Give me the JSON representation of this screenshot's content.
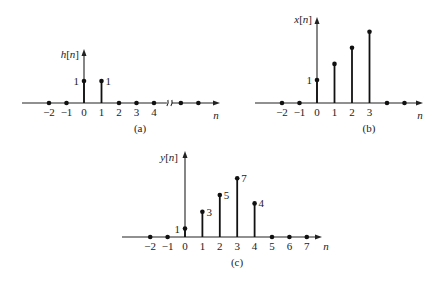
{
  "chart_data": [
    {
      "type": "stem",
      "panel": "a",
      "caption": "(a)",
      "ylabel": "h[n]",
      "xlabel": "n",
      "tick_labels": [
        "−2",
        "−1",
        "0",
        "1",
        "2",
        "3",
        "4"
      ],
      "x": [
        -2,
        -1,
        0,
        1,
        2,
        3,
        4
      ],
      "values": [
        0,
        0,
        1,
        1,
        0,
        0,
        0
      ],
      "value_labels": {
        "0": "1",
        "1": "1"
      },
      "axis_break_after": 4,
      "extra_zero_dots_after_break": 2,
      "origin": {
        "x": 84,
        "y": 103
      },
      "dx": 17.5,
      "px_per_unit": 22,
      "axis_x_range": [
        22,
        220
      ],
      "axis_top": 49,
      "ylabel_pos": {
        "x": 67,
        "y": 58
      },
      "caption_pos": {
        "x": 140,
        "y": 132
      },
      "xlabel_pos": {
        "x": 216,
        "y": 119
      }
    },
    {
      "type": "stem",
      "panel": "b",
      "caption": "(b)",
      "ylabel": "x[n]",
      "xlabel": "n",
      "tick_labels": [
        "−2",
        "−1",
        "0",
        "1",
        "2",
        "3"
      ],
      "x": [
        -2,
        -1,
        0,
        1,
        2,
        3
      ],
      "values": [
        0,
        0,
        1,
        1.7,
        2.4,
        3.1
      ],
      "value_labels": {
        "0": "1"
      },
      "trailing_zero_dots": 2,
      "origin": {
        "x": 317,
        "y": 103
      },
      "dx": 17.5,
      "px_per_unit": 23,
      "axis_x_range": [
        255,
        423
      ],
      "axis_top": 17,
      "ylabel_pos": {
        "x": 300,
        "y": 23
      },
      "caption_pos": {
        "x": 369,
        "y": 132
      },
      "xlabel_pos": {
        "x": 420,
        "y": 119
      }
    },
    {
      "type": "stem",
      "panel": "c",
      "caption": "(c)",
      "ylabel": "y[n]",
      "xlabel": "n",
      "tick_labels": [
        "−2",
        "−1",
        "0",
        "1",
        "2",
        "3",
        "4",
        "5",
        "6",
        "7"
      ],
      "x": [
        -2,
        -1,
        0,
        1,
        2,
        3,
        4,
        5,
        6,
        7
      ],
      "values": [
        0,
        0,
        1,
        3,
        5,
        7,
        4,
        0,
        0,
        0
      ],
      "value_labels": {
        "0": "1",
        "1": "3",
        "2": "5",
        "3": "7",
        "4": "4"
      },
      "origin": {
        "x": 185,
        "y": 237
      },
      "dx": 17.4,
      "px_per_unit": 8.4,
      "axis_x_range": [
        122,
        322
      ],
      "axis_top": 151,
      "ylabel_pos": {
        "x": 166,
        "y": 161
      },
      "caption_pos": {
        "x": 237,
        "y": 266
      },
      "xlabel_pos": {
        "x": 326,
        "y": 250
      }
    }
  ]
}
